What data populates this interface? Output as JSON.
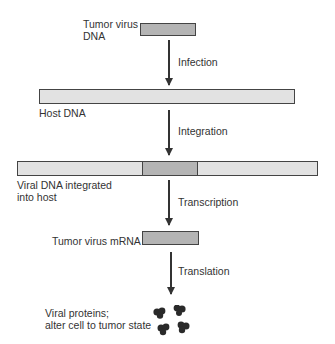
{
  "diagram": {
    "nodes": {
      "tumor_virus_dna": {
        "label_line1": "Tumor virus",
        "label_line2": "DNA"
      },
      "host_dna": {
        "label": "Host DNA"
      },
      "integrated": {
        "label_line1": "Viral DNA integrated",
        "label_line2": "into host"
      },
      "mrna": {
        "label": "Tumor virus mRNA"
      },
      "proteins": {
        "label_line1": "Viral proteins;",
        "label_line2": "alter cell to tumor state"
      }
    },
    "steps": {
      "infection": "Infection",
      "integration": "Integration",
      "transcription": "Transcription",
      "translation": "Translation"
    },
    "colors": {
      "host_dna": "#e2e2e2",
      "viral_dna": "#b4b4b4",
      "protein": "#2a2a2a"
    }
  }
}
